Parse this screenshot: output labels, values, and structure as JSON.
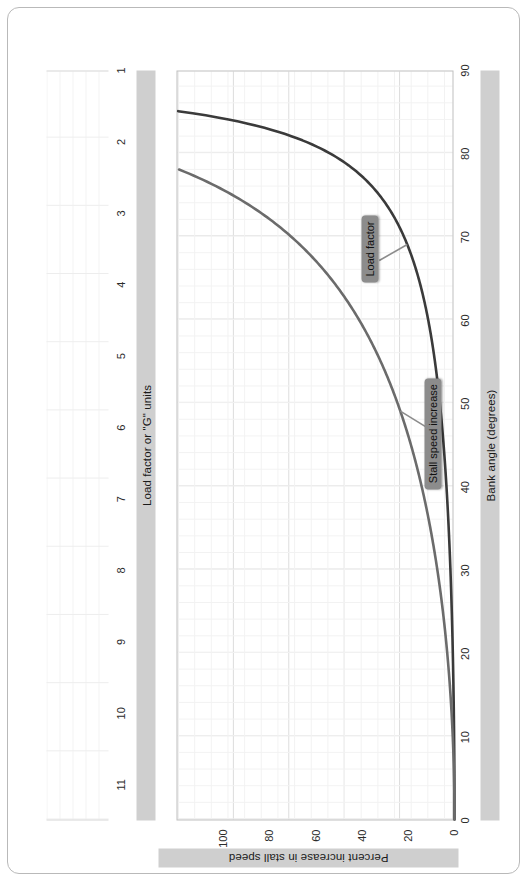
{
  "figure": {
    "title": "",
    "frame_style": "rounded-rectangle"
  },
  "axes": {
    "x": {
      "label": "Bank angle (degrees)",
      "ticks": [
        0,
        10,
        20,
        30,
        40,
        50,
        60,
        70,
        80,
        90
      ],
      "min": 0,
      "max": 90
    },
    "y_left": {
      "label": "Percent increase in stall speed",
      "ticks": [
        0,
        20,
        40,
        60,
        80,
        100
      ],
      "min": 0,
      "max": 120
    },
    "y_secondary": {
      "label": "Load factor or \"G\" units",
      "ticks": [
        1,
        2,
        3,
        4,
        5,
        6,
        7,
        8,
        9,
        10,
        11
      ],
      "min": 1,
      "max": 11.5
    }
  },
  "annotations": [
    {
      "id": "load-factor",
      "text": "Load factor"
    },
    {
      "id": "stall-speed-increase",
      "text": "Stall speed increase"
    }
  ],
  "colors": {
    "load_factor_curve": "#3a3a3a",
    "stall_speed_curve": "#6b6b6b",
    "callout_bg": "#8c8c8c",
    "axis_band_bg": "#cfcfcf",
    "grid_major": "#dcdcdc",
    "grid_minor": "#f2f2f2",
    "frame_border": "#b9b9b9"
  },
  "chart_data": {
    "type": "line",
    "title": "",
    "xlabel": "Bank angle (degrees)",
    "ylabel": "Percent increase in stall speed",
    "y2label": "Load factor or \"G\" units",
    "xlim": [
      0,
      90
    ],
    "ylim": [
      0,
      120
    ],
    "y2lim": [
      1,
      11.5
    ],
    "xticks": [
      0,
      10,
      20,
      30,
      40,
      50,
      60,
      70,
      80,
      90
    ],
    "yticks": [
      0,
      20,
      40,
      60,
      80,
      100
    ],
    "y2ticks": [
      1,
      2,
      3,
      4,
      5,
      6,
      7,
      8,
      9,
      10,
      11
    ],
    "grid": true,
    "legend": "annotated-callouts",
    "x": [
      0,
      5,
      10,
      15,
      20,
      25,
      30,
      35,
      40,
      45,
      50,
      55,
      60,
      65,
      70,
      75,
      80,
      82,
      84,
      85,
      86,
      87,
      88
    ],
    "series": [
      {
        "name": "Load factor",
        "axis": "y2",
        "units": "G",
        "formula": "n = 1 / cos(bank)",
        "values": [
          1.0,
          1.0,
          1.02,
          1.04,
          1.06,
          1.1,
          1.15,
          1.22,
          1.31,
          1.41,
          1.56,
          1.74,
          2.0,
          2.37,
          2.92,
          3.86,
          5.76,
          7.19,
          9.57,
          11.47,
          14.34,
          19.11,
          28.65
        ]
      },
      {
        "name": "Stall speed increase",
        "axis": "y1",
        "units": "percent",
        "formula": "(sqrt(1/cos(bank)) - 1) * 100",
        "values": [
          0.0,
          0.1,
          0.8,
          1.7,
          3.2,
          5.0,
          7.5,
          10.3,
          14.3,
          18.9,
          24.9,
          32.0,
          41.4,
          54.0,
          70.9,
          96.5,
          140.0,
          168.2,
          209.4,
          238.7,
          278.7,
          337.1,
          435.2
        ]
      }
    ]
  }
}
